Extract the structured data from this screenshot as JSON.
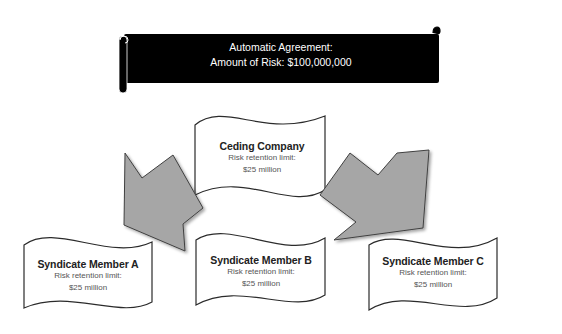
{
  "banner": {
    "line1": "Automatic Agreement:",
    "line2": "Amount of Risk: $100,000,000",
    "fill": "#000000",
    "text_color": "#ffffff"
  },
  "nodes": [
    {
      "id": "ceding",
      "title": "Ceding Company",
      "subtitle": "Risk retention limit:",
      "amount": "$25 million"
    },
    {
      "id": "member-a",
      "title": "Syndicate Member A",
      "subtitle": "Risk retention limit:",
      "amount": "$25 million"
    },
    {
      "id": "member-b",
      "title": "Syndicate Member B",
      "subtitle": "Risk retention limit:",
      "amount": "$25 million"
    },
    {
      "id": "member-c",
      "title": "Syndicate Member C",
      "subtitle": "Risk retention limit:",
      "amount": "$25 million"
    }
  ],
  "arrows": [
    {
      "from": "ceding",
      "to": "member-a",
      "direction": "down-right",
      "fill": "#a6a6a6"
    },
    {
      "from": "ceding",
      "to": "member-c",
      "direction": "down-right",
      "fill": "#a6a6a6"
    }
  ],
  "colors": {
    "wave_fill": "#ffffff",
    "wave_stroke": "#2b2b2b",
    "arrow_fill": "#a6a6a6",
    "arrow_stroke": "#404040"
  }
}
